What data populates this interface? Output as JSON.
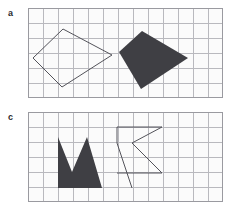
{
  "figure": {
    "background_color": "#ffffff",
    "grid_line_color": "#b9b9be",
    "grid_border_color": "#9a9aa0",
    "grid_fill_color": "#fbfbfb",
    "shape_fill_color": "#3f3f44",
    "shape_stroke_color": "#53535a",
    "label_color": "#2b2b2e",
    "cell_size": 15
  },
  "panels": [
    {
      "id": "a",
      "label": "a",
      "grid": {
        "x": 28,
        "y": 8,
        "cols": 13,
        "rows": 6,
        "width": 195,
        "height": 90
      },
      "shapes": [
        {
          "name": "outlined-quadrilateral",
          "style": "outline",
          "fill": "none",
          "stroke": "#53535a",
          "stroke_width": 1,
          "points": [
            [
              5,
              50
            ],
            [
              35,
              21
            ],
            [
              84,
              47
            ],
            [
              34,
              79
            ]
          ]
        },
        {
          "name": "filled-quadrilateral",
          "style": "filled",
          "fill": "#3f3f44",
          "stroke": "none",
          "points": [
            [
              114,
              23
            ],
            [
              160,
              50
            ],
            [
              113,
              81
            ],
            [
              91,
              44
            ]
          ]
        }
      ]
    },
    {
      "id": "c",
      "label": "c",
      "grid": {
        "x": 28,
        "y": 112,
        "cols": 13,
        "rows": 6,
        "width": 195,
        "height": 90
      },
      "shapes": [
        {
          "name": "filled-crown-polygon",
          "style": "filled",
          "fill": "#3f3f44",
          "stroke": "none",
          "points": [
            [
              30,
              25
            ],
            [
              44,
              60
            ],
            [
              59,
              25
            ],
            [
              74,
              76
            ],
            [
              104,
              76
            ],
            [
              30,
              76
            ]
          ]
        },
        {
          "name": "outlined-chevron-polyline",
          "style": "outline",
          "fill": "none",
          "stroke": "#53535a",
          "stroke_width": 1,
          "points": [
            [
              104,
              76
            ],
            [
              89,
              31
            ],
            [
              89,
              15
            ],
            [
              134,
              15
            ],
            [
              104,
              31
            ],
            [
              134,
              61
            ],
            [
              89,
              61
            ]
          ],
          "closed": false
        }
      ]
    }
  ]
}
